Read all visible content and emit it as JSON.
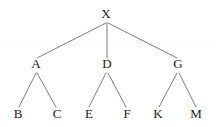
{
  "diagram": {
    "type": "tree",
    "background_color": "#ffffff",
    "edge_color": "#6e6e6e",
    "label_color": "#1a1a1a",
    "levels": 3,
    "root": "X",
    "nodes": [
      {
        "id": "X",
        "label": "X",
        "x": 106,
        "y": 18,
        "level": 0,
        "parent": null
      },
      {
        "id": "A",
        "label": "A",
        "x": 36,
        "y": 68,
        "level": 1,
        "parent": "X"
      },
      {
        "id": "D",
        "label": "D",
        "x": 107,
        "y": 68,
        "level": 1,
        "parent": "X"
      },
      {
        "id": "G",
        "label": "G",
        "x": 178,
        "y": 68,
        "level": 1,
        "parent": "X"
      },
      {
        "id": "B",
        "label": "B",
        "x": 18,
        "y": 118,
        "level": 2,
        "parent": "A"
      },
      {
        "id": "C",
        "label": "C",
        "x": 57,
        "y": 118,
        "level": 2,
        "parent": "A"
      },
      {
        "id": "E",
        "label": "E",
        "x": 89,
        "y": 118,
        "level": 2,
        "parent": "D"
      },
      {
        "id": "F",
        "label": "F",
        "x": 127,
        "y": 118,
        "level": 2,
        "parent": "D"
      },
      {
        "id": "K",
        "label": "K",
        "x": 158,
        "y": 118,
        "level": 2,
        "parent": "G"
      },
      {
        "id": "M",
        "label": "M",
        "x": 196,
        "y": 118,
        "level": 2,
        "parent": "G"
      }
    ],
    "edges": [
      {
        "from": "X",
        "to": "A",
        "x1": 106,
        "y1": 23,
        "x2": 37,
        "y2": 58
      },
      {
        "from": "X",
        "to": "D",
        "x1": 107,
        "y1": 23,
        "x2": 107,
        "y2": 58
      },
      {
        "from": "X",
        "to": "G",
        "x1": 108,
        "y1": 23,
        "x2": 177,
        "y2": 58
      },
      {
        "from": "A",
        "to": "B",
        "x1": 36,
        "y1": 73,
        "x2": 19,
        "y2": 107
      },
      {
        "from": "A",
        "to": "C",
        "x1": 37,
        "y1": 73,
        "x2": 56,
        "y2": 107
      },
      {
        "from": "D",
        "to": "E",
        "x1": 106,
        "y1": 73,
        "x2": 89,
        "y2": 107
      },
      {
        "from": "D",
        "to": "F",
        "x1": 108,
        "y1": 73,
        "x2": 126,
        "y2": 107
      },
      {
        "from": "G",
        "to": "K",
        "x1": 177,
        "y1": 73,
        "x2": 159,
        "y2": 107
      },
      {
        "from": "G",
        "to": "M",
        "x1": 179,
        "y1": 73,
        "x2": 196,
        "y2": 107
      }
    ]
  }
}
